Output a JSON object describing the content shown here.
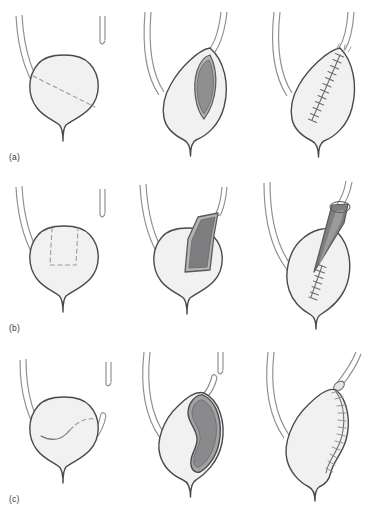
{
  "figure": {
    "background_color": "#ffffff",
    "rows": [
      {
        "id": "a",
        "label": "(a)",
        "technique": "transverse vesical (lens) incision closure",
        "panels": [
          {
            "id": "a1",
            "stage": "planned incision",
            "caption": "",
            "elements": [
              "bladder",
              "urethra",
              "ureter-left",
              "ureter-stub-right",
              "dashed-incision-line"
            ]
          },
          {
            "id": "a2",
            "stage": "incision opened",
            "caption": "",
            "elements": [
              "bladder",
              "urethra",
              "ureter-left",
              "ureter-right",
              "open-lens-defect"
            ]
          },
          {
            "id": "a3",
            "stage": "closed with sutures",
            "caption": "",
            "elements": [
              "bladder",
              "urethra",
              "ureter-left",
              "ureter-right",
              "suture-line"
            ]
          }
        ]
      },
      {
        "id": "b",
        "label": "(b)",
        "technique": "Boari flap tubularisation",
        "panels": [
          {
            "id": "b1",
            "stage": "planned U-shaped flap",
            "caption": "",
            "elements": [
              "bladder",
              "urethra",
              "ureter-left",
              "ureter-stub-right",
              "dashed-u-flap-outline"
            ]
          },
          {
            "id": "b2",
            "stage": "flap elevated",
            "caption": "",
            "elements": [
              "bladder",
              "urethra",
              "ureter-left",
              "ureter-stub-right",
              "raised-flap"
            ]
          },
          {
            "id": "b3",
            "stage": "flap tubularised and anastomosed",
            "caption": "",
            "elements": [
              "bladder",
              "urethra",
              "ureter-left",
              "ureter-right",
              "tubularised-flap",
              "suture-line"
            ]
          }
        ]
      },
      {
        "id": "c",
        "label": "(c)",
        "technique": "psoas hitch / lateral bladder flap",
        "panels": [
          {
            "id": "c1",
            "stage": "planned oblique incision",
            "caption": "",
            "elements": [
              "bladder",
              "urethra",
              "ureter-left",
              "ureter-right-short",
              "curved-incision-line"
            ]
          },
          {
            "id": "c2",
            "stage": "bladder opened and hitched",
            "caption": "",
            "elements": [
              "bladder",
              "urethra",
              "ureter-left",
              "ureter-right",
              "open-bean-defect"
            ]
          },
          {
            "id": "c3",
            "stage": "closed with sutures",
            "caption": "",
            "elements": [
              "bladder",
              "urethra",
              "ureter-left",
              "ureter-right",
              "curved-suture-line"
            ]
          }
        ]
      }
    ],
    "colors": {
      "outline": "#4a4a4d",
      "outline_light": "#8e8e91",
      "bladder_fill": "#f1f1f1",
      "lumen_dark": "#8f8f90",
      "lumen_mid": "#b4b4b5",
      "flap_fill": "#7e7e80",
      "dashed_line": "#9a9a9c",
      "suture": "#6c6c6f",
      "tube_fill": "#f6f6f6",
      "label_text": "#38383a"
    }
  }
}
